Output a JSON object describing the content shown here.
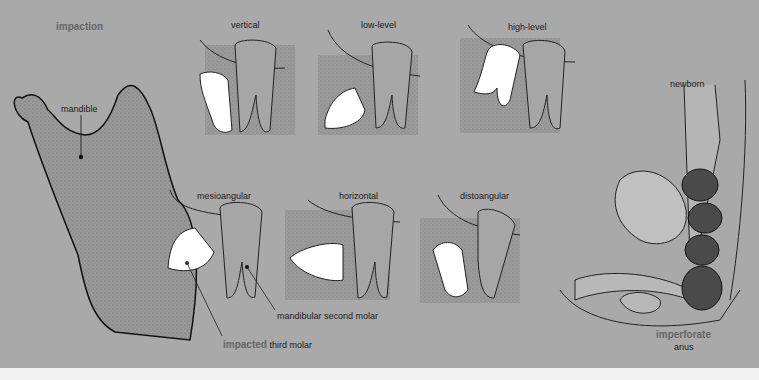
{
  "figure": {
    "section_title": "impaction",
    "mandible": {
      "label": "mandible"
    },
    "impaction_types": [
      {
        "label": "vertical"
      },
      {
        "label": "low-level"
      },
      {
        "label": "high-level"
      },
      {
        "label": "mesioangular"
      },
      {
        "label": "horizontal"
      },
      {
        "label": "distoangular"
      }
    ],
    "annotations": {
      "second_molar": "mandibular second molar",
      "impacted_prefix": "impacted",
      "impacted_suffix": "third molar"
    },
    "newborn_panel": {
      "title": "newborn",
      "label_highlight": "imperforate",
      "label_rest": "anus"
    }
  },
  "colors": {
    "background": "#a9a9a9",
    "stipple": "#8f8f8f",
    "tooth": "#ffffff",
    "molar": "#a3a3a3",
    "highlight_text": "#666666",
    "bowel": "#4a4a4a"
  }
}
